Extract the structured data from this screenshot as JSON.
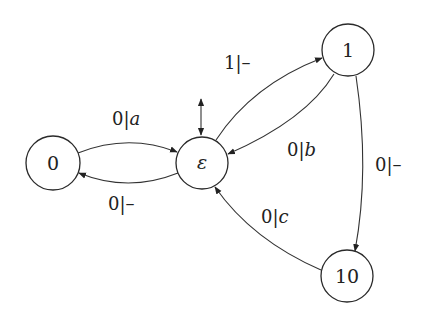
{
  "diagram": {
    "type": "state-machine",
    "colors": {
      "stroke": "#333333",
      "background": "#ffffff",
      "text": "#222222"
    },
    "nodes": [
      {
        "id": "0",
        "label": "0"
      },
      {
        "id": "eps",
        "label": "ε",
        "initial_marker": "double-arrow above"
      },
      {
        "id": "1",
        "label": "1"
      },
      {
        "id": "10",
        "label": "10"
      }
    ],
    "edges": [
      {
        "from": "0",
        "to": "eps",
        "input": "0",
        "sep": "|",
        "output": "a"
      },
      {
        "from": "eps",
        "to": "0",
        "input": "0",
        "sep": "|",
        "output": "–"
      },
      {
        "from": "eps",
        "to": "1",
        "input": "1",
        "sep": "|",
        "output": "–"
      },
      {
        "from": "1",
        "to": "eps",
        "input": "0",
        "sep": "|",
        "output": "b"
      },
      {
        "from": "1",
        "to": "10",
        "input": "0",
        "sep": "|",
        "output": "–"
      },
      {
        "from": "10",
        "to": "eps",
        "input": "0",
        "sep": "|",
        "output": "c"
      }
    ]
  }
}
